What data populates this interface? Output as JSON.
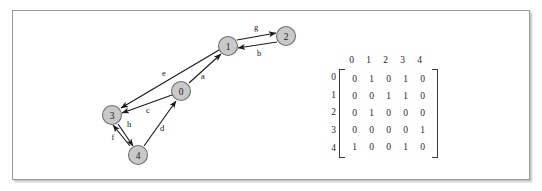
{
  "figure": {
    "frame_border_color": "#9a9a9a",
    "background_color": "#ffffff"
  },
  "graph": {
    "node_fill_color": "#c9c9c9",
    "node_stroke_color": "#6e6e6e",
    "edge_color": "#1a1a1a",
    "nodes": [
      {
        "id": "0",
        "label": "0",
        "cx": 181,
        "cy": 91
      },
      {
        "id": "1",
        "label": "1",
        "cx": 228,
        "cy": 46
      },
      {
        "id": "2",
        "label": "2",
        "cx": 286,
        "cy": 36
      },
      {
        "id": "3",
        "label": "3",
        "cx": 112,
        "cy": 115
      },
      {
        "id": "4",
        "label": "4",
        "cx": 138,
        "cy": 155
      }
    ],
    "edges": [
      {
        "label": "a",
        "from": "0",
        "to": "1",
        "label_x": 203,
        "label_y": 76
      },
      {
        "label": "b",
        "from": "2",
        "to": "1",
        "label_x": 259,
        "label_y": 53
      },
      {
        "label": "c",
        "from": "0",
        "to": "3",
        "label_x": 148,
        "label_y": 110
      },
      {
        "label": "d",
        "from": "4",
        "to": "0",
        "label_x": 162,
        "label_y": 128
      },
      {
        "label": "e",
        "from": "1",
        "to": "3",
        "label_x": 164,
        "label_y": 73
      },
      {
        "label": "f",
        "from": "4",
        "to": "3",
        "label_x": 113,
        "label_y": 137
      },
      {
        "label": "g",
        "from": "1",
        "to": "2",
        "label_x": 256,
        "label_y": 27
      },
      {
        "label": "h",
        "from": "3",
        "to": "4",
        "label_x": 129,
        "label_y": 124
      }
    ]
  },
  "matrix": {
    "column_headers": [
      "0",
      "1",
      "2",
      "3",
      "4"
    ],
    "row_labels": [
      "0",
      "1",
      "2",
      "3",
      "4"
    ],
    "rows": [
      [
        "0",
        "1",
        "0",
        "1",
        "0"
      ],
      [
        "0",
        "0",
        "1",
        "1",
        "0"
      ],
      [
        "0",
        "1",
        "0",
        "0",
        "0"
      ],
      [
        "0",
        "0",
        "0",
        "0",
        "1"
      ],
      [
        "1",
        "0",
        "0",
        "1",
        "0"
      ]
    ]
  }
}
